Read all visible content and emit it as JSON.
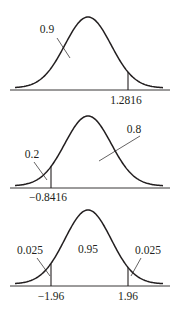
{
  "figure": {
    "panels": [
      {
        "id": "panel-1",
        "curve": {
          "x_left": 15,
          "x_right": 163,
          "x_peak": 88,
          "y_base": 88,
          "y_peak": 17
        },
        "axis": {
          "y": 90,
          "x1": 10,
          "x2": 170
        },
        "cutoffs": [
          {
            "x": 128,
            "label": "1.2816",
            "label_x": 126,
            "label_y": 104
          }
        ],
        "areas": [
          {
            "value": "0.9",
            "label_x": 47,
            "label_y": 33,
            "leader": [
              57,
              38,
              70,
              58
            ]
          }
        ]
      },
      {
        "id": "panel-2",
        "curve": {
          "x_left": 15,
          "x_right": 163,
          "x_peak": 88,
          "y_base": 186,
          "y_peak": 116
        },
        "axis": {
          "y": 188,
          "x1": 10,
          "x2": 170
        },
        "cutoffs": [
          {
            "x": 51,
            "label": "−0.8416",
            "label_x": 48,
            "label_y": 201
          }
        ],
        "areas": [
          {
            "value": "0.2",
            "label_x": 32,
            "label_y": 158,
            "leader": [
              34,
              162,
              47,
              180
            ]
          },
          {
            "value": "0.8",
            "label_x": 134,
            "label_y": 133,
            "leader": [
              140,
              136,
              99,
              161
            ]
          }
        ]
      },
      {
        "id": "panel-3",
        "curve": {
          "x_left": 15,
          "x_right": 163,
          "x_peak": 88,
          "y_base": 284,
          "y_peak": 210
        },
        "axis": {
          "y": 286,
          "x1": 10,
          "x2": 170
        },
        "cutoffs": [
          {
            "x": 51,
            "label": "−1.96",
            "label_x": 51,
            "label_y": 300
          },
          {
            "x": 128,
            "label": "1.96",
            "label_x": 128,
            "label_y": 300
          }
        ],
        "areas": [
          {
            "value": "0.025",
            "label_x": 30,
            "label_y": 254,
            "leader": [
              37,
              258,
              50,
              276
            ]
          },
          {
            "value": "0.95",
            "label_x": 88,
            "label_y": 253,
            "leader": null
          },
          {
            "value": "0.025",
            "label_x": 148,
            "label_y": 254,
            "leader": [
              141,
              258,
              131,
              276
            ]
          }
        ]
      }
    ]
  }
}
